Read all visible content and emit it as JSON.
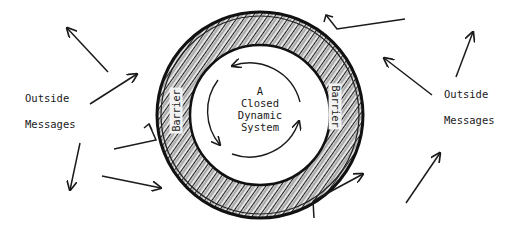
{
  "diagram": {
    "center_label": [
      "A",
      "Closed",
      "Dynamic",
      "System"
    ],
    "barrier_left": "Barrier",
    "barrier_right": "Barrier",
    "left_label": {
      "line1": "Outside",
      "line2": "Messages"
    },
    "right_label": {
      "line1": "Outside",
      "line2": "Messages"
    },
    "colors": {
      "ink": "#1a1a1a",
      "background": "#ffffff",
      "ring_shade": "#3a3a3a"
    }
  }
}
